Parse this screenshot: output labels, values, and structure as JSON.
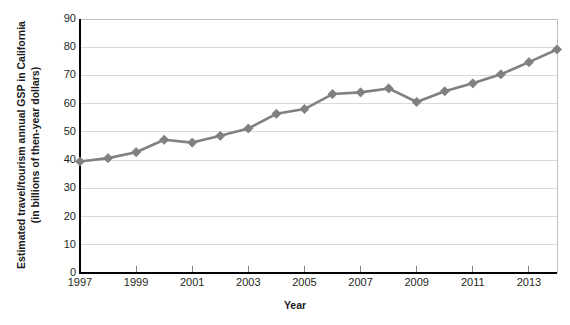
{
  "chart_data": {
    "type": "line",
    "title": "",
    "xlabel": "Year",
    "ylabel": "Estimated travel/tourism annual GSP in California (in billions of then-year dollars)",
    "ylabel_line1": "Estimated travel/tourism annual GSP in California",
    "ylabel_line2": "(in billions of then-year dollars)",
    "x": [
      1997,
      1998,
      1999,
      2000,
      2001,
      2002,
      2003,
      2004,
      2005,
      2006,
      2007,
      2008,
      2009,
      2010,
      2011,
      2012,
      2013,
      2014
    ],
    "values": [
      39.5,
      40.7,
      42.8,
      47.2,
      46.2,
      48.6,
      51.2,
      56.4,
      58.1,
      63.4,
      64.0,
      65.4,
      60.6,
      64.4,
      67.2,
      70.4,
      74.7,
      79.2
    ],
    "series": [
      {
        "name": "Estimated travel/tourism annual GSP in California",
        "values": [
          39.5,
          40.7,
          42.8,
          47.2,
          46.2,
          48.6,
          51.2,
          56.4,
          58.1,
          63.4,
          64.0,
          65.4,
          60.6,
          64.4,
          67.2,
          70.4,
          74.7,
          79.2
        ]
      }
    ],
    "xlim": [
      1997,
      2014
    ],
    "ylim": [
      0,
      90
    ],
    "ytick_labels": [
      "0",
      "10",
      "20",
      "30",
      "40",
      "50",
      "60",
      "70",
      "80",
      "90"
    ],
    "yticks": [
      0,
      10,
      20,
      30,
      40,
      50,
      60,
      70,
      80,
      90
    ],
    "xtick_labels": [
      "1997",
      "1999",
      "2001",
      "2003",
      "2005",
      "2007",
      "2009",
      "2011",
      "2013"
    ],
    "xticks": [
      1997,
      1999,
      2001,
      2003,
      2005,
      2007,
      2009,
      2011,
      2013
    ],
    "grid": "horizontal",
    "legend": "none",
    "marker": "diamond",
    "series_color": "#808080",
    "grid_color": "#d9d9d9",
    "axis_color": "#000000",
    "plot_border_color": "#bfbfbf",
    "text_color": "#231f20"
  }
}
